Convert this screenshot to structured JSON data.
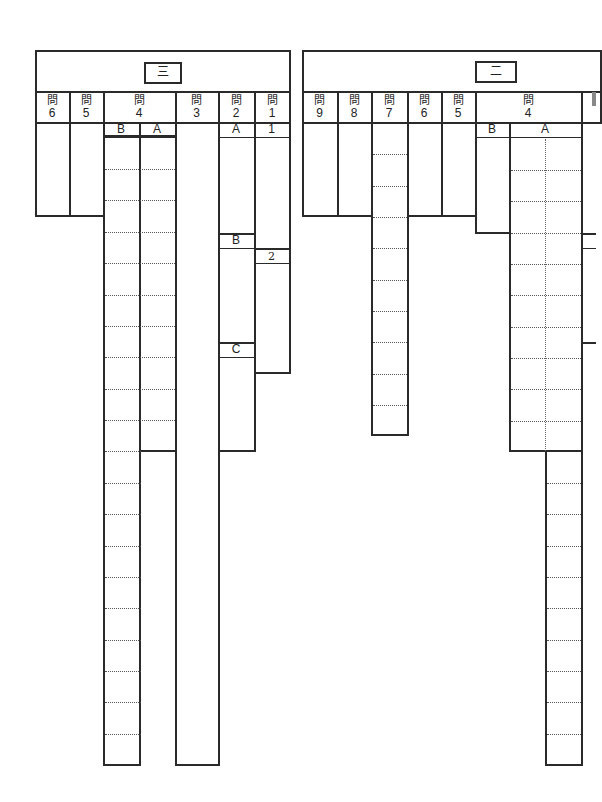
{
  "sections": {
    "san": {
      "title": "三",
      "questions": [
        {
          "kanji": "問",
          "num": "6"
        },
        {
          "kanji": "問",
          "num": "5"
        },
        {
          "kanji": "問",
          "num": "4"
        },
        {
          "kanji": "問",
          "num": "3"
        },
        {
          "kanji": "問",
          "num": "2"
        },
        {
          "kanji": "問",
          "num": "1"
        }
      ],
      "q4_sub": {
        "b": "B",
        "a": "A"
      },
      "q2_sub": {
        "a": "A",
        "b": "B",
        "c": "C"
      },
      "q1_sub": {
        "one": "1",
        "two": "2"
      }
    },
    "ni": {
      "title": "二",
      "questions": [
        {
          "kanji": "問",
          "num": "9"
        },
        {
          "kanji": "問",
          "num": "8"
        },
        {
          "kanji": "問",
          "num": "7"
        },
        {
          "kanji": "問",
          "num": "6"
        },
        {
          "kanji": "問",
          "num": "5"
        },
        {
          "kanji": "問",
          "num": "4"
        }
      ],
      "q4_sub": {
        "b": "B",
        "a": "A"
      }
    }
  },
  "colors": {
    "line": "#2a2a2a",
    "background": "#ffffff"
  }
}
